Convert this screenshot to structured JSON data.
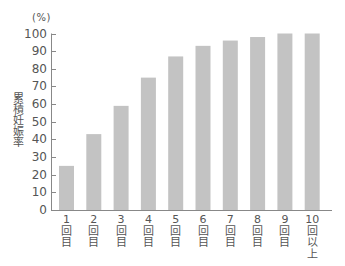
{
  "chart_data": {
    "type": "bar",
    "title": "",
    "xlabel": "",
    "ylabel": "累積妊娠率",
    "yunit": "(%)",
    "ylim": [
      0,
      100
    ],
    "yticks": [
      0,
      10,
      20,
      30,
      40,
      50,
      60,
      70,
      80,
      90,
      100
    ],
    "categories": [
      "1回目",
      "2回目",
      "3回目",
      "4回目",
      "5回目",
      "6回目",
      "7回目",
      "8回目",
      "9回目",
      "10回以上"
    ],
    "category_lines": [
      [
        "1",
        "回",
        "目"
      ],
      [
        "2",
        "回",
        "目"
      ],
      [
        "3",
        "回",
        "目"
      ],
      [
        "4",
        "回",
        "目"
      ],
      [
        "5",
        "回",
        "目"
      ],
      [
        "6",
        "回",
        "目"
      ],
      [
        "7",
        "回",
        "目"
      ],
      [
        "8",
        "回",
        "目"
      ],
      [
        "9",
        "回",
        "目"
      ],
      [
        "10",
        "回",
        "以",
        "上"
      ]
    ],
    "values": [
      25,
      43,
      59,
      75,
      87,
      93,
      96,
      98,
      100,
      100
    ],
    "grid": false,
    "legend": null,
    "bar_color": "#c3c3c3",
    "axis_color": "#888888"
  }
}
